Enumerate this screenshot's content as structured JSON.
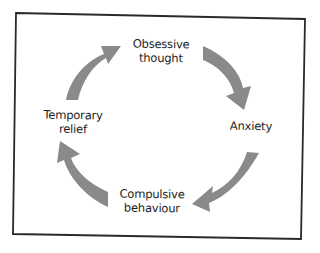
{
  "diagram": {
    "type": "cycle",
    "frame_color": "#2a2a2a",
    "arrow_color": "#8a8a8a",
    "text_color": "#1c1c1c",
    "nodes": [
      {
        "id": "obsessive-thought",
        "line1": "Obsessive",
        "line2": "thought"
      },
      {
        "id": "anxiety",
        "line1": "Anxiety",
        "line2": ""
      },
      {
        "id": "compulsive-behaviour",
        "line1": "Compulsive",
        "line2": "behaviour"
      },
      {
        "id": "temporary-relief",
        "line1": "Temporary",
        "line2": "relief"
      }
    ],
    "edges": [
      {
        "from": "obsessive-thought",
        "to": "anxiety"
      },
      {
        "from": "anxiety",
        "to": "compulsive-behaviour"
      },
      {
        "from": "compulsive-behaviour",
        "to": "temporary-relief"
      },
      {
        "from": "temporary-relief",
        "to": "obsessive-thought"
      }
    ]
  }
}
